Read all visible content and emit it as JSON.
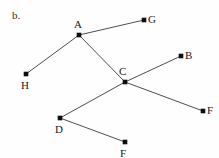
{
  "figure": {
    "part_label": "b.",
    "background_color": "#fefefe",
    "edge_color": "#3a3a3a",
    "node_color": "#0d0d0d",
    "label_color": "#1a1a1a",
    "width": 219,
    "height": 158
  },
  "chart_data": {
    "type": "diagram",
    "title": "b.",
    "nodes": [
      {
        "id": "A",
        "label": "A",
        "x": 79,
        "y": 35,
        "label_x": 74,
        "label_y": 19
      },
      {
        "id": "G",
        "label": "G",
        "x": 144,
        "y": 20,
        "label_x": 148,
        "label_y": 14
      },
      {
        "id": "H",
        "label": "H",
        "x": 26,
        "y": 74,
        "label_x": 21,
        "label_y": 80
      },
      {
        "id": "C",
        "label": "C",
        "x": 125,
        "y": 82,
        "label_x": 119,
        "label_y": 66
      },
      {
        "id": "B",
        "label": "B",
        "x": 181,
        "y": 56,
        "label_x": 185,
        "label_y": 50
      },
      {
        "id": "F1",
        "label": "F",
        "x": 203,
        "y": 111,
        "label_x": 207,
        "label_y": 105
      },
      {
        "id": "D",
        "label": "D",
        "x": 60,
        "y": 118,
        "label_x": 55,
        "label_y": 124
      },
      {
        "id": "F2",
        "label": "F",
        "x": 125,
        "y": 142,
        "label_x": 120,
        "label_y": 148
      }
    ],
    "edges": [
      {
        "from": "A",
        "to": "G"
      },
      {
        "from": "A",
        "to": "H"
      },
      {
        "from": "A",
        "to": "C"
      },
      {
        "from": "C",
        "to": "B"
      },
      {
        "from": "C",
        "to": "F1"
      },
      {
        "from": "C",
        "to": "D"
      },
      {
        "from": "D",
        "to": "F2"
      }
    ],
    "node_radius": 2.3
  }
}
